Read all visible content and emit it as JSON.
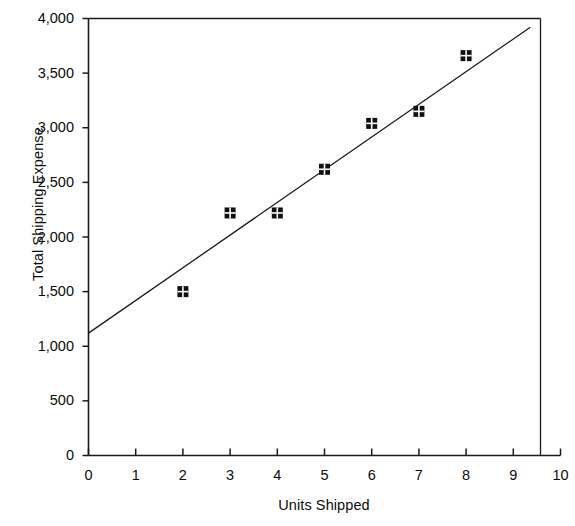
{
  "chart_data": {
    "type": "scatter",
    "title": "",
    "xlabel": "Units Shipped",
    "ylabel": "Total Shipping Expense",
    "xlim": [
      0,
      10
    ],
    "ylim": [
      0,
      4000
    ],
    "grid": false,
    "legend": null,
    "x": [
      2,
      3,
      4,
      5,
      6,
      7,
      8
    ],
    "values": [
      1500,
      2220,
      2220,
      2620,
      3040,
      3150,
      3660
    ],
    "points": [
      {
        "x": 2,
        "y": 1500
      },
      {
        "x": 3,
        "y": 2220
      },
      {
        "x": 4,
        "y": 2220
      },
      {
        "x": 5,
        "y": 2620
      },
      {
        "x": 6,
        "y": 3040
      },
      {
        "x": 7,
        "y": 3150
      },
      {
        "x": 8,
        "y": 3660
      }
    ],
    "trendline": {
      "type": "linear",
      "x_start": 0,
      "y_start": 1120,
      "x_end": 9.36,
      "y_end": 3920
    },
    "x_ticks": [
      0,
      1,
      2,
      3,
      4,
      5,
      6,
      7,
      8,
      9,
      10
    ],
    "x_tick_labels": [
      "0",
      "1",
      "2",
      "3",
      "4",
      "5",
      "6",
      "7",
      "8",
      "9",
      "10"
    ],
    "y_ticks": [
      0,
      500,
      1000,
      1500,
      2000,
      2500,
      3000,
      3500,
      4000
    ],
    "y_tick_labels": [
      "0",
      "500",
      "1,000",
      "1,500",
      "2,000",
      "2,500",
      "3,000",
      "3,500",
      "4,000"
    ],
    "marker_style": "filled-square-with-white-cross",
    "colors": {
      "marker": "#101010",
      "line": "#1a1a1a",
      "axis": "#1a1a1a",
      "text": "#0b0b0b",
      "background": "#ffffff"
    }
  }
}
